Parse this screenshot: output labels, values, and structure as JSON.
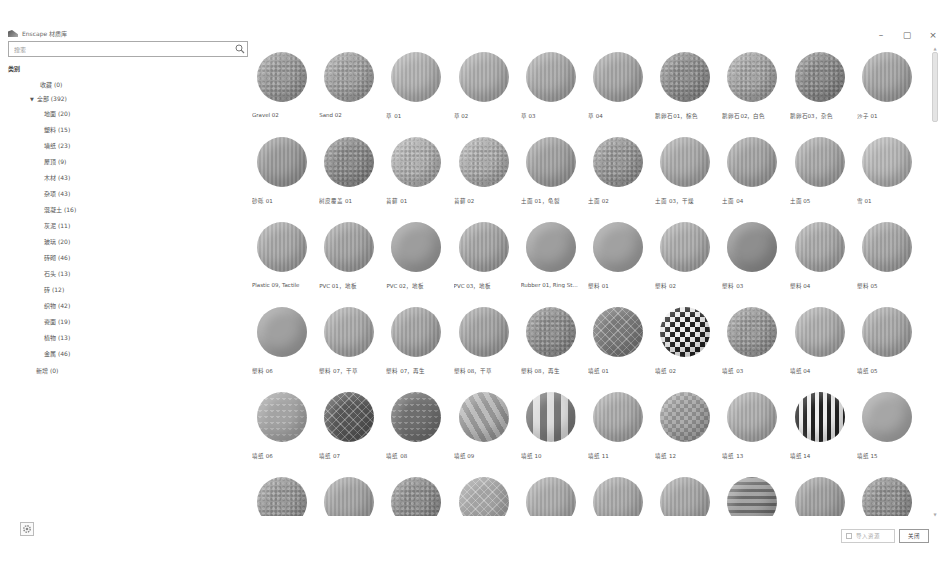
{
  "window": {
    "title": "Enscape 材质库",
    "controls": {
      "minimize": "–",
      "maximize": "▢",
      "close": "×"
    }
  },
  "search": {
    "placeholder": "搜索",
    "value": ""
  },
  "sidebar": {
    "section_title": "类别",
    "favorites": "收藏 (0)",
    "all": "全部 (392)",
    "categories": [
      "地面 (20)",
      "塑料 (15)",
      "墙纸 (23)",
      "屋顶 (9)",
      "木材 (43)",
      "杂项 (43)",
      "混凝土 (16)",
      "灰泥 (11)",
      "玻璃 (20)",
      "砖砌 (46)",
      "石头 (13)",
      "砖 (12)",
      "织物 (42)",
      "瓷面 (19)",
      "植物 (13)",
      "金属 (46)"
    ],
    "new": "新增 (0)"
  },
  "materials": [
    {
      "label": "Gravel 02",
      "tone": "#9b9b9b",
      "pattern": "noise"
    },
    {
      "label": "Sand 02",
      "tone": "#a2a2a2",
      "pattern": "noise"
    },
    {
      "label": "草 01",
      "tone": "#b0b0b0",
      "pattern": "stripes"
    },
    {
      "label": "草 02",
      "tone": "#acacac",
      "pattern": "stripes"
    },
    {
      "label": "草 03",
      "tone": "#a8a8a8",
      "pattern": "stripes"
    },
    {
      "label": "草 04",
      "tone": "#a6a6a6",
      "pattern": "stripes"
    },
    {
      "label": "鹅卵石01，棕色",
      "tone": "#8f8f8f",
      "pattern": "noise"
    },
    {
      "label": "鹅卵石02，白色",
      "tone": "#a5a5a5",
      "pattern": "noise"
    },
    {
      "label": "鹅卵石03，杂色",
      "tone": "#8a8a8a",
      "pattern": "noise"
    },
    {
      "label": "沙子 01",
      "tone": "#a4a4a4",
      "pattern": "stripes"
    },
    {
      "label": "砂砾 01",
      "tone": "#9a9a9a",
      "pattern": "stripes"
    },
    {
      "label": "树皮覆盖 01",
      "tone": "#8c8c8c",
      "pattern": "noise"
    },
    {
      "label": "苔藓 01",
      "tone": "#b2b2b2",
      "pattern": "noise"
    },
    {
      "label": "苔藓 02",
      "tone": "#adadad",
      "pattern": "noise"
    },
    {
      "label": "土面 01，龟裂",
      "tone": "#a0a0a0",
      "pattern": "stripes"
    },
    {
      "label": "土面 02",
      "tone": "#999999",
      "pattern": "noise"
    },
    {
      "label": "土面 03，干燥",
      "tone": "#a9a9a9",
      "pattern": "stripes"
    },
    {
      "label": "土面 04",
      "tone": "#a3a3a3",
      "pattern": "stripes"
    },
    {
      "label": "土面 05",
      "tone": "#a7a7a7",
      "pattern": "stripes"
    },
    {
      "label": "雪 01",
      "tone": "#b5b5b5",
      "pattern": "stripes"
    },
    {
      "label": "Plastic 09, Tactile",
      "tone": "#a6a6a6",
      "pattern": "stripes"
    },
    {
      "label": "PVC 01，地板",
      "tone": "#a2a2a2",
      "pattern": "stripes"
    },
    {
      "label": "PVC 02，地板",
      "tone": "#9d9d9d",
      "pattern": "plain"
    },
    {
      "label": "PVC 03，地板",
      "tone": "#a4a4a4",
      "pattern": "stripes"
    },
    {
      "label": "Rubber 01, Ring St...",
      "tone": "#9e9e9e",
      "pattern": "plain"
    },
    {
      "label": "塑料 01",
      "tone": "#a1a1a1",
      "pattern": "plain"
    },
    {
      "label": "塑料 02",
      "tone": "#aaaaaa",
      "pattern": "stripes"
    },
    {
      "label": "塑料 03",
      "tone": "#8e8e8e",
      "pattern": "plain"
    },
    {
      "label": "塑料 04",
      "tone": "#a8a8a8",
      "pattern": "stripes"
    },
    {
      "label": "塑料 05",
      "tone": "#a5a5a5",
      "pattern": "stripes"
    },
    {
      "label": "塑料 06",
      "tone": "#a0a0a0",
      "pattern": "plain"
    },
    {
      "label": "塑料 07，干草",
      "tone": "#a9a9a9",
      "pattern": "stripes"
    },
    {
      "label": "塑料 07，再生",
      "tone": "#a4a4a4",
      "pattern": "stripes"
    },
    {
      "label": "塑料 08，干草",
      "tone": "#a2a2a2",
      "pattern": "stripes"
    },
    {
      "label": "塑料 08，再生",
      "tone": "#909090",
      "pattern": "noise"
    },
    {
      "label": "墙纸 01",
      "tone": "#777777",
      "pattern": "diamond"
    },
    {
      "label": "墙纸 02",
      "tone": "#3a3a3a",
      "pattern": "checker"
    },
    {
      "label": "墙纸 03",
      "tone": "#9a9a9a",
      "pattern": "noise"
    },
    {
      "label": "墙纸 04",
      "tone": "#acacac",
      "pattern": "stripes"
    },
    {
      "label": "墙纸 05",
      "tone": "#a7a7a7",
      "pattern": "stripes"
    },
    {
      "label": "墙纸 06",
      "tone": "#a3a3a3",
      "pattern": "zigzag"
    },
    {
      "label": "墙纸 07",
      "tone": "#555555",
      "pattern": "diamond"
    },
    {
      "label": "墙纸 08",
      "tone": "#6e6e6e",
      "pattern": "zigzag"
    },
    {
      "label": "墙纸 09",
      "tone": "#b0b0b0",
      "pattern": "diagonal"
    },
    {
      "label": "墙纸 10",
      "tone": "#9a9a9a",
      "pattern": "wave"
    },
    {
      "label": "墙纸 11",
      "tone": "#a9a9a9",
      "pattern": "stripes"
    },
    {
      "label": "墙纸 12",
      "tone": "#a0a0a0",
      "pattern": "checker-soft"
    },
    {
      "label": "墙纸 13",
      "tone": "#acacac",
      "pattern": "stripes"
    },
    {
      "label": "墙纸 14",
      "tone": "#555555",
      "pattern": "vstripes"
    },
    {
      "label": "墙纸 15",
      "tone": "#a6a6a6",
      "pattern": "plain"
    },
    {
      "label": "",
      "tone": "#999999",
      "pattern": "noise"
    },
    {
      "label": "",
      "tone": "#a3a3a3",
      "pattern": "stripes"
    },
    {
      "label": "",
      "tone": "#8f8f8f",
      "pattern": "noise"
    },
    {
      "label": "",
      "tone": "#a2a2a2",
      "pattern": "diamond"
    },
    {
      "label": "",
      "tone": "#aaaaaa",
      "pattern": "stripes"
    },
    {
      "label": "",
      "tone": "#a8a8a8",
      "pattern": "stripes"
    },
    {
      "label": "",
      "tone": "#a6a6a6",
      "pattern": "stripes"
    },
    {
      "label": "",
      "tone": "#8e8e8e",
      "pattern": "hstripes"
    },
    {
      "label": "",
      "tone": "#9f9f9f",
      "pattern": "stripes"
    },
    {
      "label": "",
      "tone": "#929292",
      "pattern": "noise"
    }
  ],
  "footer": {
    "import_label": "导入资源",
    "close_label": "关闭"
  }
}
